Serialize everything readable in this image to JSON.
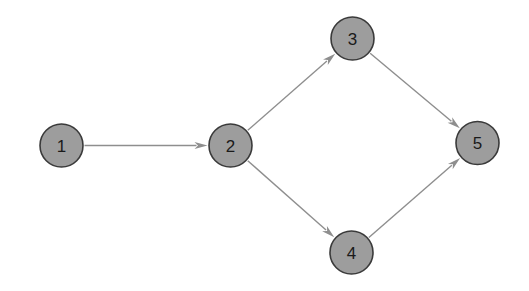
{
  "figure": {
    "kind": "directed-graph",
    "background_color": "#ffffff",
    "width": 529,
    "height": 291
  },
  "style": {
    "node_fill": "#9d9d9d",
    "node_stroke": "#3a3a3a",
    "node_stroke_width": 1.6,
    "node_radius": 21.5,
    "label_color": "#1a1a1a",
    "label_font_size": 17,
    "edge_color": "#8e8e8e",
    "edge_width": 1.4,
    "arrowhead_length": 13,
    "arrowhead_half_width": 3.6
  },
  "graph": {
    "directed": true,
    "node_count": 5,
    "edge_count": 5,
    "nodes": [
      {
        "id": "1",
        "label": "1",
        "x": 61.5,
        "y": 145.5,
        "r": 21.5
      },
      {
        "id": "2",
        "label": "2",
        "x": 230.5,
        "y": 145.5,
        "r": 21.5
      },
      {
        "id": "3",
        "label": "3",
        "x": 352.5,
        "y": 38.5,
        "r": 21.5
      },
      {
        "id": "4",
        "label": "4",
        "x": 351.5,
        "y": 252.5,
        "r": 21.5
      },
      {
        "id": "5",
        "label": "5",
        "x": 477.5,
        "y": 143.0,
        "r": 21.5
      }
    ],
    "edges": [
      {
        "id": "e1",
        "from": "1",
        "to": "2",
        "label": ""
      },
      {
        "id": "e2",
        "from": "2",
        "to": "3",
        "label": ""
      },
      {
        "id": "e3",
        "from": "2",
        "to": "4",
        "label": ""
      },
      {
        "id": "e4",
        "from": "3",
        "to": "5",
        "label": ""
      },
      {
        "id": "e5",
        "from": "4",
        "to": "5",
        "label": ""
      }
    ]
  }
}
